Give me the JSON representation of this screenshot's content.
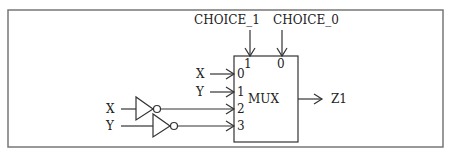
{
  "diagram": {
    "block_label": "MUX",
    "select_inputs": [
      {
        "name": "CHOICE_1",
        "pin": "1"
      },
      {
        "name": "CHOICE_0",
        "pin": "0"
      }
    ],
    "data_inputs": [
      {
        "signal": "X",
        "pin": "0",
        "inverted": false
      },
      {
        "signal": "Y",
        "pin": "1",
        "inverted": false
      },
      {
        "signal": "X",
        "pin": "2",
        "inverted": true
      },
      {
        "signal": "Y",
        "pin": "3",
        "inverted": true
      }
    ],
    "output": {
      "name": "Z1"
    },
    "colors": {
      "line": "#333333",
      "frame": "#777777",
      "background": "#ffffff"
    }
  }
}
